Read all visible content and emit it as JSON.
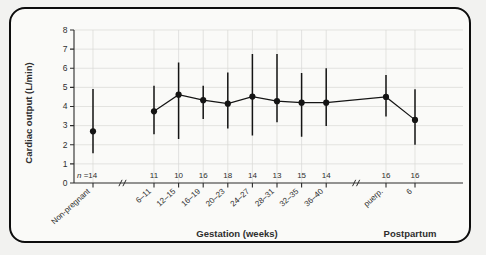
{
  "chart_data": {
    "type": "line",
    "title": "",
    "xlabel": "Gestation (weeks)",
    "ylabel": "Cardiac output (L/min)",
    "ylim": [
      0,
      8
    ],
    "yticks": [
      0,
      1,
      2,
      3,
      4,
      5,
      6,
      7,
      8
    ],
    "grid": true,
    "legend": null,
    "categories": [
      "Non-pregnant",
      "6–11",
      "12–15",
      "16–19",
      "20–23",
      "24–27",
      "28–31",
      "32–35",
      "36–40",
      "puerp.",
      "6"
    ],
    "n_label": "n =14",
    "n_label_italic": "n",
    "n_label_rest": " =14",
    "n_values": [
      14,
      11,
      10,
      16,
      18,
      14,
      13,
      15,
      14,
      16,
      16
    ],
    "series": [
      {
        "name": "Cardiac output",
        "values": [
          2.7,
          3.75,
          4.62,
          4.33,
          4.15,
          4.52,
          4.28,
          4.2,
          4.2,
          4.5,
          3.3
        ],
        "err_low": [
          1.55,
          2.55,
          2.3,
          3.35,
          2.85,
          2.48,
          3.18,
          2.42,
          2.98,
          3.48,
          2.0
        ],
        "err_high": [
          4.92,
          5.08,
          6.3,
          5.08,
          5.78,
          6.75,
          6.75,
          5.75,
          6.0,
          5.65,
          4.9
        ]
      }
    ],
    "connected_from_index": 1,
    "axis_breaks": [
      "after Non-pregnant",
      "after 36–40"
    ],
    "break_glyph": "//",
    "group_labels": [
      {
        "text": "Gestation (weeks)",
        "span": "6–11 to 36–40"
      },
      {
        "text": "Postpartum",
        "span": "puerp. to 6"
      }
    ]
  },
  "colors": {
    "frame": "#0d0d0d",
    "page_background": "#f2f2f0",
    "plot_background": "#fafaf8",
    "axis": "#2b2b2b",
    "grid": "#d8d8d6",
    "marker": "#141414",
    "text": "#2e2e2e"
  }
}
